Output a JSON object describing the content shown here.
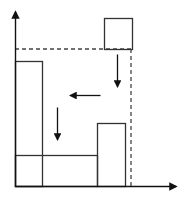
{
  "diagram": {
    "title": "",
    "colors": {
      "stroke": "#333333",
      "dash": "#444444",
      "background": "#ffffff"
    },
    "axes": {
      "y_axis": {
        "x": 15,
        "y_top": 12,
        "y_bottom": 187
      },
      "x_axis": {
        "y": 186,
        "x_left": 15,
        "x_right": 176
      }
    },
    "guides": {
      "horizontal_dashed": {
        "y": 49,
        "x1": 15,
        "x2": 132
      },
      "vertical_dashed": {
        "x": 131,
        "y1": 49,
        "y2": 186
      }
    },
    "blocks": [
      {
        "name": "falling-square",
        "x": 104,
        "y": 18,
        "w": 28,
        "h": 31
      },
      {
        "name": "tall-left-block",
        "x": 15,
        "y": 61,
        "w": 27,
        "h": 125
      },
      {
        "name": "wide-bottom-block",
        "x": 15,
        "y": 155,
        "w": 82,
        "h": 31
      },
      {
        "name": "right-block",
        "x": 97,
        "y": 123,
        "w": 28,
        "h": 63
      }
    ],
    "arrows": [
      {
        "name": "arrow-down-right",
        "direction": "down",
        "x1": 117,
        "y1": 54,
        "x2": 117,
        "y2": 86
      },
      {
        "name": "arrow-left",
        "direction": "left",
        "x1": 100,
        "y1": 95,
        "x2": 70,
        "y2": 95
      },
      {
        "name": "arrow-down-left",
        "direction": "down",
        "x1": 57,
        "y1": 107,
        "x2": 57,
        "y2": 139
      }
    ]
  }
}
